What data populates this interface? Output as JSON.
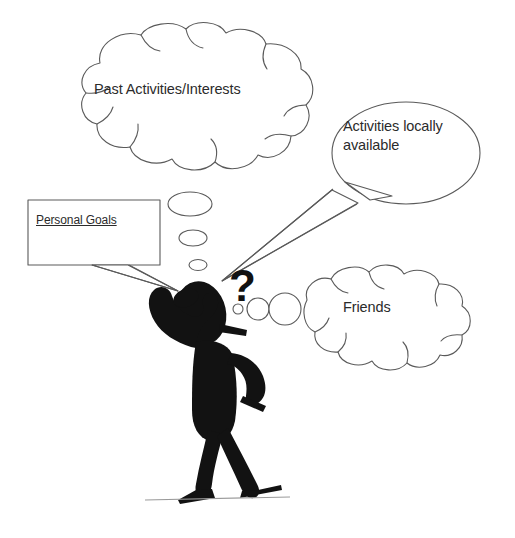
{
  "diagram": {
    "background_color": "#ffffff",
    "figure_color": "#121212",
    "outline_color": "#5a5a5a",
    "text_color": "#2b2b2b",
    "ground_line_color": "#9a9a9a"
  },
  "callouts": {
    "past_activities": {
      "label": "Past Activities/Interests",
      "shape": "thought-cloud"
    },
    "activities_local": {
      "label": "Activities locally\navailable",
      "shape": "speech-ellipse"
    },
    "friends": {
      "label": "Friends",
      "shape": "thought-cloud"
    },
    "personal_goals": {
      "label": "Personal Goals",
      "shape": "speech-rectangle",
      "underlined": true
    }
  },
  "marks": {
    "question_mark": "?"
  },
  "icons": {
    "stick_figure": "thinking-person-icon",
    "thought_trail_left": "thought-bubble-trail-icon",
    "thought_trail_right": "thought-bubble-trail-icon",
    "ground": "ground-line-icon"
  }
}
